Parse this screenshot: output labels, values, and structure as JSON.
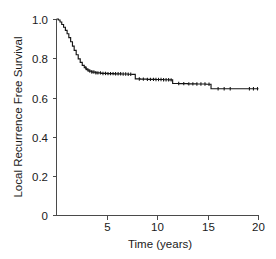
{
  "chart_data": {
    "type": "line",
    "subtype": "kaplan-meier-survival",
    "title": "",
    "xlabel": "Time (years)",
    "ylabel": "Local Recurrence Free Survival",
    "xlim": [
      0,
      20
    ],
    "ylim": [
      0,
      1.0
    ],
    "xticks": [
      0,
      5,
      10,
      15,
      20
    ],
    "xtick_labels": [
      "0",
      "5",
      "10",
      "15",
      "20"
    ],
    "yticks": [
      0,
      0.2,
      0.4,
      0.6,
      0.8,
      1.0
    ],
    "ytick_labels": [
      "0",
      "0.2",
      "0.4",
      "0.6",
      "0.8",
      "1.0"
    ],
    "grid": false,
    "legend": false,
    "legend_position": "none",
    "series": [
      {
        "name": "Local Recurrence Free Survival",
        "color": "#141414",
        "x": [
          0.0,
          0.18,
          0.35,
          0.52,
          0.7,
          0.88,
          1.05,
          1.22,
          1.4,
          1.58,
          1.75,
          1.95,
          2.15,
          2.35,
          2.55,
          2.75,
          2.95,
          3.2,
          3.5,
          3.9,
          4.4,
          5.0,
          5.7,
          6.4,
          7.1,
          7.5,
          7.8,
          8.3,
          9.0,
          9.8,
          10.6,
          11.2,
          11.5,
          12.2,
          13.0,
          13.9,
          14.8,
          15.3,
          16.2,
          17.2,
          18.4,
          20.0
        ],
        "y": [
          1.0,
          0.995,
          0.985,
          0.972,
          0.958,
          0.942,
          0.925,
          0.905,
          0.884,
          0.862,
          0.84,
          0.818,
          0.797,
          0.779,
          0.764,
          0.752,
          0.742,
          0.735,
          0.73,
          0.726,
          0.723,
          0.722,
          0.721,
          0.72,
          0.719,
          0.718,
          0.695,
          0.694,
          0.693,
          0.692,
          0.691,
          0.69,
          0.672,
          0.671,
          0.67,
          0.669,
          0.668,
          0.645,
          0.645,
          0.645,
          0.645,
          0.645
        ]
      }
    ],
    "censor_times": [
      2.9,
      3.1,
      3.3,
      3.5,
      3.7,
      3.9,
      4.1,
      4.35,
      4.6,
      4.85,
      5.1,
      5.35,
      5.6,
      5.85,
      6.1,
      6.35,
      6.6,
      6.85,
      7.1,
      7.35,
      8.2,
      8.6,
      9.0,
      9.3,
      9.6,
      9.85,
      10.1,
      10.35,
      10.6,
      10.85,
      11.1,
      11.35,
      12.1,
      12.6,
      13.1,
      13.5,
      13.9,
      14.3,
      14.7,
      15.1,
      16.0,
      16.6,
      17.2,
      19.1,
      19.5,
      19.9
    ]
  },
  "axes": {
    "x_title": "Time (years)",
    "y_title": "Local Recurrence Free Survival",
    "x_tick_labels": [
      "0",
      "5",
      "10",
      "15",
      "20"
    ],
    "y_tick_labels": [
      "1.0",
      "0.8",
      "0.6",
      "0.4",
      "0.2",
      "0"
    ]
  },
  "colors": {
    "curve": "#141414",
    "axis": "#4a4a4a",
    "text": "#1a1a1a",
    "background": "#ffffff"
  }
}
